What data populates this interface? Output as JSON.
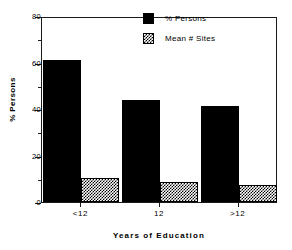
{
  "chart_data": {
    "type": "bar",
    "title": "",
    "xlabel": "Years of Education",
    "ylabel": "% Persons",
    "categories": [
      "<12",
      "12",
      ">12"
    ],
    "series": [
      {
        "name": "% Persons",
        "values": [
          61,
          44,
          41.5
        ],
        "style": "solid"
      },
      {
        "name": "Mean # Sites",
        "values": [
          10.5,
          8.5,
          7.5
        ],
        "style": "hatch"
      }
    ],
    "ylim": [
      0,
      80
    ],
    "yticks": [
      0,
      20,
      40,
      60,
      80
    ],
    "ytick_labels": [
      "0",
      "20",
      "40",
      "60",
      "80"
    ],
    "yminor_ticks": [
      10,
      30,
      50,
      70
    ],
    "grid": false,
    "legend_position": "top-right"
  },
  "legend": {
    "items": [
      {
        "label": "% Persons",
        "style": "solid"
      },
      {
        "label": "Mean # Sites",
        "style": "hatch"
      }
    ]
  },
  "axes": {
    "x_title": "Years of Education",
    "y_title": "% Persons",
    "x_labels": [
      "<12",
      "12",
      ">12"
    ],
    "y_labels": [
      "80",
      "60",
      "40",
      "20",
      "0"
    ]
  }
}
